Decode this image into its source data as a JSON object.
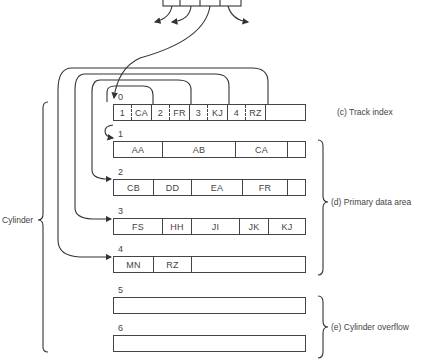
{
  "cylinder_index": {
    "label": "(b) Cylinder indexes"
  },
  "track_index": {
    "number": "0",
    "entries": [
      {
        "key": "1",
        "value": "CA"
      },
      {
        "key": "2",
        "value": "FR"
      },
      {
        "key": "3",
        "value": "KJ"
      },
      {
        "key": "4",
        "value": "RZ"
      }
    ],
    "label": "(c) Track index"
  },
  "primary_tracks": [
    {
      "number": "1",
      "records": [
        "AA",
        "AB",
        "CA",
        ""
      ]
    },
    {
      "number": "2",
      "records": [
        "CB",
        "DD",
        "EA",
        "FR",
        ""
      ]
    },
    {
      "number": "3",
      "records": [
        "FS",
        "HH",
        "JI",
        "JK",
        "KJ"
      ]
    },
    {
      "number": "4",
      "records": [
        "MN",
        "RZ",
        ""
      ]
    }
  ],
  "primary_label": "(d) Primary data area",
  "overflow_tracks": [
    {
      "number": "5"
    },
    {
      "number": "6"
    }
  ],
  "overflow_label": "(e) Cylinder overflow",
  "cylinder_label": "Cylinder"
}
